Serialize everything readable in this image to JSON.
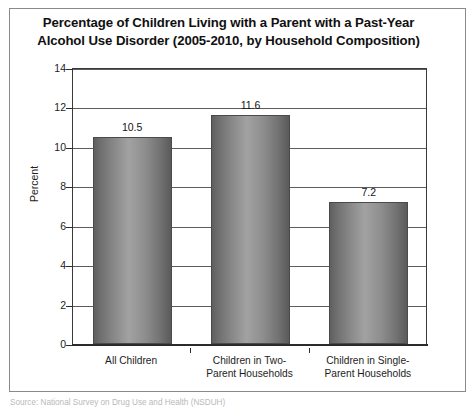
{
  "figure": {
    "title_line_1": "Percentage of Children Living with a Parent with a Past-Year",
    "title_line_2": "Alcohol Use Disorder (2005-2010, by Household Composition)",
    "source_note": "Source: National Survey on Drug Use and Health (NSDUH)"
  },
  "chart_data": {
    "type": "bar",
    "title": "Percentage of Children Living with a Parent with a Past-Year Alcohol Use Disorder (2005-2010, by Household Composition)",
    "categories": [
      "All Children",
      "Children in Two-Parent Households",
      "Children in Single-Parent Households"
    ],
    "category_lines": [
      [
        "All Children"
      ],
      [
        "Children in Two-",
        "Parent Households"
      ],
      [
        "Children in Single-",
        "Parent Households"
      ]
    ],
    "values": [
      10.5,
      11.6,
      7.2
    ],
    "value_labels": [
      "10.5",
      "11.6",
      "7.2"
    ],
    "xlabel": "",
    "ylabel": "Percent",
    "ylim": [
      0,
      14
    ],
    "ytick_step": 2,
    "yticks": [
      0,
      2,
      4,
      6,
      8,
      10,
      12,
      14
    ],
    "ytick_labels": [
      "0",
      "2",
      "4",
      "6",
      "8",
      "10",
      "12",
      "14"
    ],
    "grid": true,
    "grid_axis": "y",
    "legend": null,
    "legend_position": "none",
    "series_name": "Percent",
    "bar_fill": "#8a8a8a",
    "bar_edge": "#4a4a4a",
    "axis_color": "#2b2b2b",
    "text_color": "#1d1d1d",
    "background": "#ffffff"
  }
}
